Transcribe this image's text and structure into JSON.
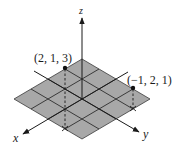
{
  "diagram": {
    "type": "3d-coordinate-system",
    "axes": {
      "x": {
        "label": "x"
      },
      "y": {
        "label": "y"
      },
      "z": {
        "label": "z"
      }
    },
    "plane": {
      "description": "xy-plane shaded grid, 4 by 4 unit squares",
      "fill_color": "#a8a8a8",
      "grid_color": "#2a2a2a"
    },
    "points": [
      {
        "label": "(2, 1, 3)",
        "coords": [
          2,
          1,
          3
        ]
      },
      {
        "label": "(−1, 2, 1)",
        "coords": [
          -1,
          2,
          1
        ]
      }
    ],
    "colors": {
      "line": "#1a1a1a",
      "background": "#ffffff"
    }
  }
}
